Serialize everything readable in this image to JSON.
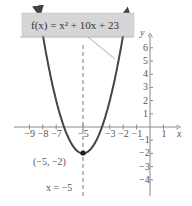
{
  "chart_data": {
    "type": "line",
    "function_label": "f(x) = x² + 10x + 23",
    "xlabel": "x",
    "ylabel": "y",
    "xlim": [
      -9.5,
      2
    ],
    "ylim": [
      -4.5,
      6.8
    ],
    "x_ticks": [
      -9,
      -8,
      -7,
      -5,
      -3,
      -2,
      -1,
      1
    ],
    "y_ticks": [
      6,
      5,
      4,
      3,
      2,
      1,
      -1,
      -2,
      -3,
      -4
    ],
    "grid": false,
    "series": [
      {
        "name": "f(x) = x^2 + 10x + 23",
        "x": [
          -8.3,
          -8,
          -7,
          -6,
          -5,
          -4,
          -3,
          -2,
          -1.7
        ],
        "y": [
          8.89,
          7,
          2,
          -1,
          -2,
          -1,
          2,
          7,
          8.89
        ]
      }
    ],
    "annotations": [
      {
        "text": "(−5, −2)",
        "point": [
          -5,
          -2
        ],
        "label": "vertex"
      },
      {
        "text": "x = −5",
        "type": "axis_of_symmetry",
        "x": -5
      }
    ]
  },
  "labels": {
    "function": "f(x) = x² + 10x + 23",
    "vertex": "(−5, −2)",
    "axis": "x = −5",
    "x_axis": "x",
    "y_axis": "y"
  }
}
